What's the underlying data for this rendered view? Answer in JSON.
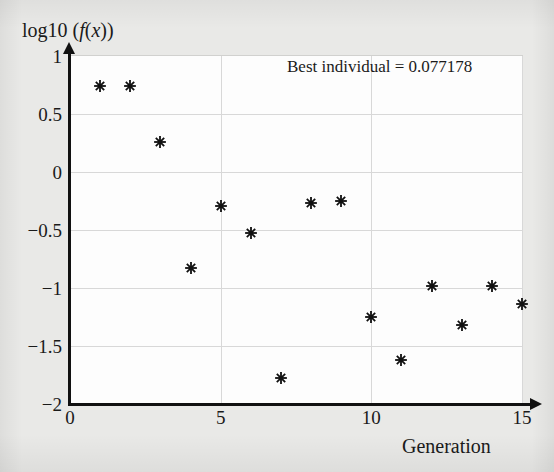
{
  "figure": {
    "background_color": "#e9e9e7",
    "plot_background_color": "#fdfdfd",
    "axis_color": "#111111",
    "grid_color": "#d8d8d8",
    "marker_color": "#111111"
  },
  "y_axis_caption": {
    "prefix": "log10 (",
    "f": "f",
    "open": "(",
    "x": "x",
    "close": "))"
  },
  "x_axis_caption": "Generation",
  "annotation": {
    "best_individual_label": "Best individual = 0.077178"
  },
  "chart_data": {
    "type": "scatter",
    "title": "",
    "xlabel": "Generation",
    "ylabel": "log10 (f(x))",
    "xlim": [
      0,
      15
    ],
    "ylim": [
      -2,
      1
    ],
    "xticks": [
      0,
      5,
      10,
      15
    ],
    "xtick_labels": [
      "0",
      "5",
      "10",
      "15"
    ],
    "yticks": [
      1,
      0.5,
      0,
      -0.5,
      -1,
      -1.5,
      -2
    ],
    "ytick_labels": [
      "1",
      "0.5",
      "0",
      "−0.5",
      "−1",
      "−1.5",
      "−2"
    ],
    "grid": true,
    "legend": null,
    "marker": "asterisk",
    "annotations": [
      {
        "text": "Best individual = 0.077178",
        "x": 9.6,
        "y": 0.82
      }
    ],
    "series": [
      {
        "name": "log10(f(x)) best-so-far per generation",
        "x": [
          1,
          2,
          3,
          4,
          5,
          6,
          7,
          8,
          9,
          10,
          11,
          12,
          13,
          14,
          15
        ],
        "y": [
          0.74,
          0.74,
          0.26,
          -0.83,
          -0.29,
          -0.53,
          -1.78,
          -0.27,
          -0.25,
          -1.25,
          -1.62,
          -0.98,
          -1.32,
          -0.98,
          -1.14
        ]
      }
    ]
  }
}
